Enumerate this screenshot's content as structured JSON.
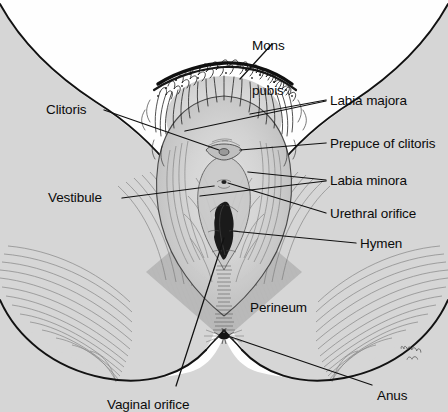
{
  "figure": {
    "signature": "Netter",
    "colors": {
      "background": "#fefefe",
      "body_fill": "#d6d6d6",
      "body_fill_light": "#dcdcdc",
      "shadow_diamond": "#b9b9b9",
      "outline": "#111111",
      "hatch": "#6f6f6f",
      "label_text": "#0b0b0b",
      "orifice_dark": "#1a1a1a"
    }
  },
  "labels": [
    {
      "id": "mons-pubis",
      "text": "Mons\npubis",
      "line1": "Mons",
      "line2": "pubis",
      "x": 252,
      "y": 8,
      "align": "left"
    },
    {
      "id": "clitoris",
      "text": "Clitoris",
      "x": 46,
      "y": 102,
      "align": "left"
    },
    {
      "id": "labia-majora",
      "text": "Labia majora",
      "x": 330,
      "y": 93,
      "align": "left"
    },
    {
      "id": "prepuce-of-clitoris",
      "text": "Prepuce of clitoris",
      "x": 330,
      "y": 136,
      "align": "left"
    },
    {
      "id": "labia-minora",
      "text": "Labia minora",
      "x": 330,
      "y": 173,
      "align": "left"
    },
    {
      "id": "vestibule",
      "text": "Vestibule",
      "x": 48,
      "y": 190,
      "align": "left"
    },
    {
      "id": "urethral-orifice",
      "text": "Urethral orifice",
      "x": 330,
      "y": 206,
      "align": "left"
    },
    {
      "id": "hymen",
      "text": "Hymen",
      "x": 360,
      "y": 236,
      "align": "left"
    },
    {
      "id": "perineum",
      "text": "Perineum",
      "x": 250,
      "y": 300,
      "align": "left"
    },
    {
      "id": "vaginal-orifice",
      "text": "Vaginal orifice",
      "x": 107,
      "y": 397,
      "align": "left"
    },
    {
      "id": "anus",
      "text": "Anus",
      "x": 377,
      "y": 388,
      "align": "left"
    }
  ],
  "structures": [
    "mons pubis",
    "labia majora",
    "labia minora",
    "prepuce of clitoris",
    "clitoris",
    "vestibule",
    "urethral orifice",
    "vaginal orifice",
    "hymen",
    "perineum",
    "anus"
  ]
}
